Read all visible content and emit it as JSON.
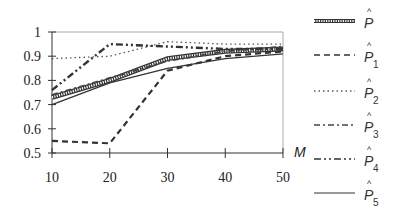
{
  "chart_data": {
    "type": "line",
    "title": "",
    "xlabel": "M",
    "ylabel": "",
    "x": [
      10,
      20,
      30,
      40,
      50
    ],
    "xticks": [
      "10",
      "20",
      "30",
      "40",
      "50"
    ],
    "yticks": [
      "0.5",
      "0.6",
      "0.7",
      "0.8",
      "0.9",
      "1"
    ],
    "xlim": [
      10,
      50
    ],
    "ylim": [
      0.5,
      1.0
    ],
    "grid": false,
    "legend_position": "right",
    "series": [
      {
        "name": "P̂",
        "label": "P",
        "sub": "",
        "style": "hatched-thick",
        "values": [
          0.73,
          0.8,
          0.89,
          0.92,
          0.93
        ]
      },
      {
        "name": "P̂1",
        "label": "P",
        "sub": "1",
        "style": "dashed",
        "values": [
          0.55,
          0.54,
          0.84,
          0.9,
          0.92
        ]
      },
      {
        "name": "P̂2",
        "label": "P",
        "sub": "2",
        "style": "dotted",
        "values": [
          0.89,
          0.9,
          0.96,
          0.95,
          0.95
        ]
      },
      {
        "name": "P̂3",
        "label": "P",
        "sub": "3",
        "style": "dash-dot",
        "values": [
          0.74,
          0.81,
          0.88,
          0.92,
          0.94
        ]
      },
      {
        "name": "P̂4",
        "label": "P",
        "sub": "4",
        "style": "dash-dot-dot",
        "values": [
          0.76,
          0.95,
          0.94,
          0.93,
          0.93
        ]
      },
      {
        "name": "P̂5",
        "label": "P",
        "sub": "5",
        "style": "solid",
        "values": [
          0.7,
          0.79,
          0.85,
          0.89,
          0.91
        ]
      }
    ]
  },
  "axis": {
    "x_title": "M"
  }
}
